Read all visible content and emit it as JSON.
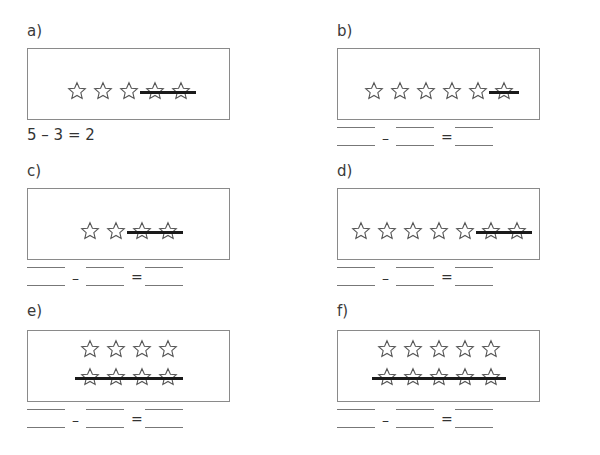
{
  "worksheet": {
    "panels": [
      {
        "id": "a",
        "label": "a)",
        "rows": [
          {
            "total": 5,
            "crossed": 2
          }
        ],
        "answer": "5 – 3 = 2",
        "solved": true
      },
      {
        "id": "b",
        "label": "b)",
        "rows": [
          {
            "total": 6,
            "crossed": 1
          }
        ],
        "solved": false
      },
      {
        "id": "c",
        "label": "c)",
        "rows": [
          {
            "total": 4,
            "crossed": 2
          }
        ],
        "solved": false
      },
      {
        "id": "d",
        "label": "d)",
        "rows": [
          {
            "total": 7,
            "crossed": 2
          }
        ],
        "solved": false
      },
      {
        "id": "e",
        "label": "e)",
        "rows": [
          {
            "total": 4,
            "crossed": 0
          },
          {
            "total": 4,
            "crossed": 4
          }
        ],
        "solved": false
      },
      {
        "id": "f",
        "label": "f)",
        "rows": [
          {
            "total": 5,
            "crossed": 0
          },
          {
            "total": 5,
            "crossed": 5
          }
        ],
        "solved": false
      }
    ],
    "operators": {
      "minus": "–",
      "equals": "="
    },
    "icon": "star-outline-icon",
    "colors": {
      "box_border": "#8a8a8a",
      "strike": "#1a1a1a",
      "star_stroke": "#555555"
    }
  }
}
